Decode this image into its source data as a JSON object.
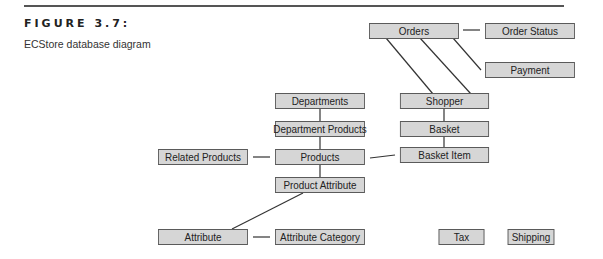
{
  "figure": {
    "label": "FIGURE 3.7:",
    "caption": "ECStore database diagram"
  },
  "colors": {
    "box_fill": "#d6d6d6",
    "box_border": "#5a5a5a",
    "line": "#333333"
  },
  "tables": {
    "orders": "Orders",
    "order_status": "Order Status",
    "payment": "Payment",
    "departments": "Departments",
    "shopper": "Shopper",
    "department_products": "Department Products",
    "basket": "Basket",
    "related_products": "Related Products",
    "products": "Products",
    "basket_item": "Basket Item",
    "product_attribute": "Product Attribute",
    "attribute": "Attribute",
    "attribute_category": "Attribute Category",
    "tax": "Tax",
    "shipping": "Shipping"
  },
  "relationships": [
    [
      "Orders",
      "Order Status"
    ],
    [
      "Orders",
      "Payment"
    ],
    [
      "Orders",
      "Shopper"
    ],
    [
      "Shopper",
      "Basket"
    ],
    [
      "Basket",
      "Basket Item"
    ],
    [
      "Products",
      "Basket Item"
    ],
    [
      "Departments",
      "Department Products"
    ],
    [
      "Department Products",
      "Products"
    ],
    [
      "Related Products",
      "Products"
    ],
    [
      "Products",
      "Product Attribute"
    ],
    [
      "Product Attribute",
      "Attribute"
    ],
    [
      "Attribute",
      "Attribute Category"
    ]
  ]
}
